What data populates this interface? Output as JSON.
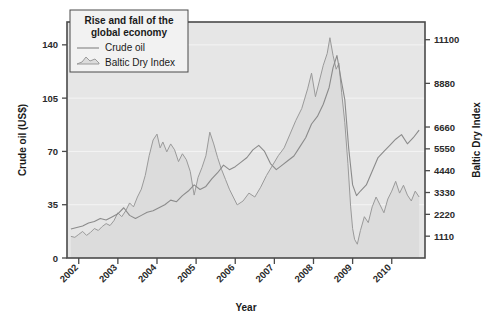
{
  "chart_data": {
    "type": "line",
    "title": "Rise and fall of the global economy",
    "xlabel": "Year",
    "grid": true,
    "legend_position": "top-left",
    "x_ticks": [
      "2002",
      "2003",
      "2004",
      "2005",
      "2006",
      "2007",
      "2008",
      "2009",
      "2010"
    ],
    "axes": [
      {
        "id": "left",
        "label": "Crude oil (US$)",
        "ticks": [
          0,
          35,
          70,
          105,
          140
        ],
        "tick_labels": [
          "0",
          "35",
          "70",
          "105",
          "140"
        ],
        "lim": [
          0,
          155
        ]
      },
      {
        "id": "right",
        "label": "Baltic Dry Index",
        "ticks": [
          1110,
          2220,
          3330,
          4440,
          5550,
          6660,
          8880,
          11100
        ],
        "tick_labels": [
          "1110",
          "2220",
          "3330",
          "4440",
          "5550",
          "6660",
          "8880",
          "11100"
        ],
        "lim": [
          0,
          12000
        ]
      }
    ],
    "series": [
      {
        "name": "Crude oil",
        "axis": "left",
        "style": "line",
        "color": "#8b8b8b",
        "x": [
          2001.8,
          2001.95,
          2002.1,
          2002.25,
          2002.4,
          2002.55,
          2002.7,
          2002.85,
          2003.0,
          2003.15,
          2003.3,
          2003.45,
          2003.6,
          2003.75,
          2003.9,
          2004.05,
          2004.2,
          2004.35,
          2004.5,
          2004.65,
          2004.8,
          2004.95,
          2005.1,
          2005.25,
          2005.4,
          2005.55,
          2005.7,
          2005.85,
          2006.0,
          2006.15,
          2006.3,
          2006.45,
          2006.6,
          2006.75,
          2006.9,
          2007.05,
          2007.2,
          2007.35,
          2007.5,
          2007.65,
          2007.8,
          2007.95,
          2008.1,
          2008.25,
          2008.4,
          2008.5,
          2008.6,
          2008.7,
          2008.8,
          2008.9,
          2009.0,
          2009.1,
          2009.2,
          2009.35,
          2009.5,
          2009.65,
          2009.8,
          2009.95,
          2010.1,
          2010.25,
          2010.4,
          2010.55,
          2010.7
        ],
        "values": [
          19,
          20,
          21,
          23,
          24,
          26,
          25,
          27,
          29,
          33,
          28,
          26,
          28,
          30,
          31,
          33,
          35,
          38,
          37,
          41,
          44,
          48,
          45,
          47,
          52,
          56,
          61,
          58,
          60,
          63,
          66,
          71,
          74,
          70,
          62,
          58,
          61,
          64,
          67,
          73,
          79,
          88,
          93,
          101,
          112,
          125,
          133,
          118,
          104,
          72,
          48,
          41,
          44,
          48,
          57,
          66,
          70,
          74,
          78,
          81,
          75,
          79,
          84
        ],
        "units": "US$ per barrel"
      },
      {
        "name": "Baltic Dry Index",
        "axis": "right",
        "style": "area",
        "color": "#9a9a9a",
        "fill": "#dcdcdc",
        "x": [
          2001.8,
          2001.9,
          2002.0,
          2002.1,
          2002.2,
          2002.3,
          2002.4,
          2002.5,
          2002.6,
          2002.7,
          2002.8,
          2002.9,
          2003.0,
          2003.1,
          2003.2,
          2003.3,
          2003.4,
          2003.5,
          2003.6,
          2003.7,
          2003.8,
          2003.9,
          2004.0,
          2004.08,
          2004.15,
          2004.25,
          2004.35,
          2004.45,
          2004.55,
          2004.65,
          2004.75,
          2004.85,
          2004.95,
          2005.05,
          2005.15,
          2005.25,
          2005.35,
          2005.45,
          2005.55,
          2005.65,
          2005.75,
          2005.85,
          2005.95,
          2006.05,
          2006.2,
          2006.35,
          2006.5,
          2006.65,
          2006.8,
          2006.95,
          2007.1,
          2007.25,
          2007.4,
          2007.55,
          2007.7,
          2007.85,
          2007.95,
          2008.05,
          2008.15,
          2008.25,
          2008.35,
          2008.42,
          2008.5,
          2008.58,
          2008.65,
          2008.72,
          2008.8,
          2008.88,
          2008.95,
          2009.0,
          2009.05,
          2009.12,
          2009.2,
          2009.3,
          2009.4,
          2009.5,
          2009.6,
          2009.7,
          2009.8,
          2009.9,
          2010.0,
          2010.1,
          2010.2,
          2010.3,
          2010.4,
          2010.5,
          2010.6,
          2010.7
        ],
        "values": [
          1100,
          1050,
          1200,
          1350,
          1150,
          1300,
          1500,
          1400,
          1600,
          1750,
          1650,
          1900,
          2300,
          2100,
          2400,
          2800,
          2600,
          3100,
          3500,
          4200,
          5200,
          6000,
          6300,
          5600,
          5900,
          5400,
          5800,
          5500,
          4900,
          5300,
          5000,
          4400,
          3200,
          4100,
          4600,
          5200,
          6400,
          5800,
          5100,
          4500,
          4000,
          3500,
          3100,
          2700,
          2900,
          3300,
          3100,
          3600,
          4200,
          4700,
          5200,
          5600,
          6300,
          7000,
          7600,
          8600,
          9400,
          8200,
          9000,
          9800,
          10400,
          11200,
          10300,
          9600,
          9900,
          8400,
          6900,
          4800,
          2600,
          1500,
          950,
          700,
          1400,
          2100,
          1800,
          2600,
          3100,
          2700,
          2300,
          3000,
          3400,
          3900,
          3300,
          3700,
          3200,
          2900,
          3400,
          3100
        ],
        "units": "index"
      }
    ],
    "annotations": []
  },
  "legend": {
    "title_line1": "Rise and fall of the",
    "title_line2": "global economy",
    "items": [
      {
        "label": "Crude oil",
        "swatch": "line"
      },
      {
        "label": "Baltic Dry Index",
        "swatch": "area"
      }
    ]
  },
  "colors": {
    "plot_background": "#e6e6e6",
    "frame": "#4a4a4a",
    "gridline": "#f4f4f4",
    "crude_oil_line": "#8b8b8b",
    "bdi_line": "#9a9a9a",
    "bdi_fill": "#dcdcdc",
    "legend_background": "#f2f2f2",
    "text": "#1a1a1a"
  }
}
